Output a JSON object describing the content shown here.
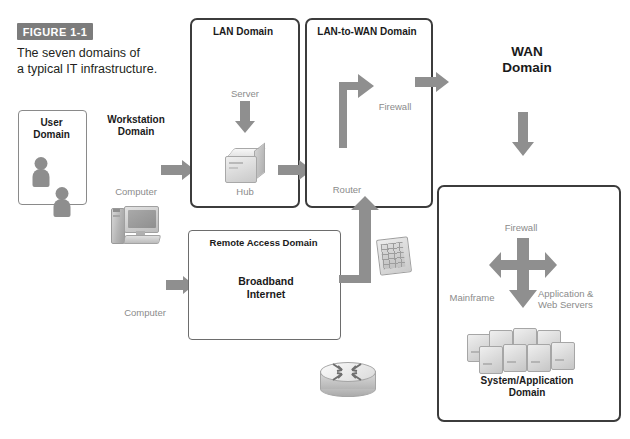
{
  "figure": {
    "badge": "FIGURE 1-1",
    "caption_line1": "The seven domains of",
    "caption_line2": "a typical IT infrastructure."
  },
  "domains": {
    "user": {
      "title_line1": "User",
      "title_line2": "Domain"
    },
    "workstation": {
      "title_line1": "Workstation",
      "title_line2": "Domain",
      "device_label": "Computer"
    },
    "lan": {
      "title": "LAN Domain",
      "device_top": "Server",
      "device_bottom": "Hub"
    },
    "lan_to_wan": {
      "title": "LAN-to-WAN Domain",
      "device_top": "Firewall",
      "device_bottom": "Router"
    },
    "wan": {
      "title_line1": "WAN",
      "title_line2": "Domain"
    },
    "remote_access": {
      "title": "Remote Access Domain",
      "cloud_line1": "Broadband",
      "cloud_line2": "Internet",
      "device_label": "Computer"
    },
    "system_application": {
      "title_line1": "System/Application",
      "title_line2": "Domain",
      "firewall_label": "Firewall",
      "mainframe_label": "Mainframe",
      "servers_label_line1": "Application &",
      "servers_label_line2": "Web Servers"
    }
  },
  "icons": {
    "user_domain": "two-people-icon",
    "remote_user": "person-icon",
    "workstation": "computer-icon",
    "remote_computer": "computer-icon",
    "lan_server": "server-icon",
    "lan_hub": "hub-icon",
    "lanwan_router": "router-icon",
    "lanwan_firewall": "firewall-icon",
    "wan_cloud": "cloud-icon",
    "broadband_cloud": "cloud-icon",
    "sys_firewall": "firewall-icon",
    "sys_mainframe": "mainframe-icon",
    "sys_servers": "server-icon",
    "sys_server_cloud": "server-cloud-icon"
  },
  "colors": {
    "badge_background": "#7c7c7c",
    "badge_text": "#ffffff",
    "domain_border": "#3c3c3c",
    "arrow_grey": "#8f8f8f",
    "cloud_grey": "#bfbfbf",
    "caption_grey": "#8b8b8b",
    "text_dark": "#231f20",
    "page_background": "#ffffff"
  }
}
